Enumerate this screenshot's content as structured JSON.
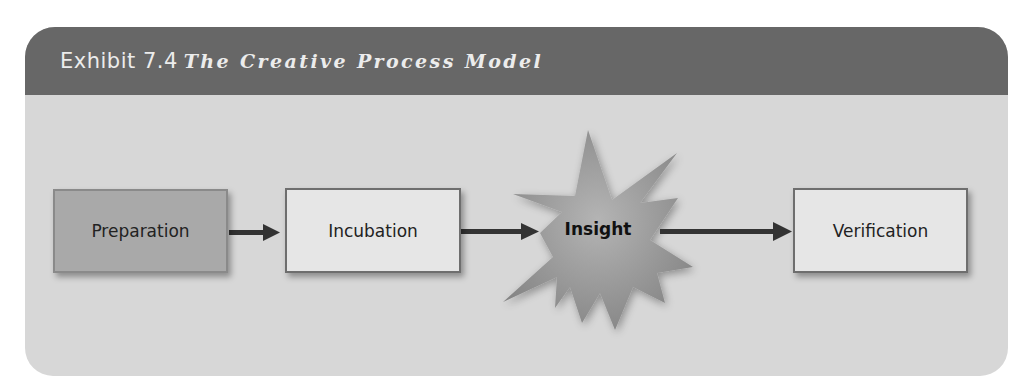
{
  "exhibit": {
    "label": "Exhibit 7.4",
    "title": "The Creative Process Model"
  },
  "diagram": {
    "type": "process-flow",
    "steps": [
      {
        "label": "Preparation",
        "shape": "rectangle",
        "fill": "#a9a9a9"
      },
      {
        "label": "Incubation",
        "shape": "rectangle",
        "fill": "#e6e6e6"
      },
      {
        "label": "Insight",
        "shape": "starburst",
        "fill": "#9a9a9a"
      },
      {
        "label": "Verification",
        "shape": "rectangle",
        "fill": "#e6e6e6"
      }
    ],
    "connections": [
      {
        "from": "Preparation",
        "to": "Incubation"
      },
      {
        "from": "Incubation",
        "to": "Insight"
      },
      {
        "from": "Insight",
        "to": "Verification"
      }
    ]
  },
  "colors": {
    "header_bg": "#676767",
    "panel_bg": "#d7d7d7",
    "arrow": "#333333"
  }
}
